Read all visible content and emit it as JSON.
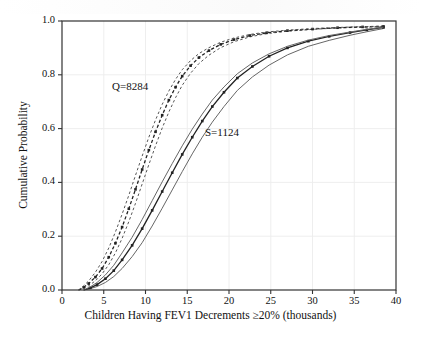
{
  "chart_data": {
    "type": "line",
    "title": "",
    "xlabel": "Children Having FEV1 Decrements ≥20% (thousands)",
    "ylabel": "Cumulative Probability",
    "xlim": [
      0,
      40
    ],
    "ylim": [
      0.0,
      1.0
    ],
    "xticks": [
      "0",
      "5",
      "10",
      "15",
      "20",
      "25",
      "30",
      "35",
      "40"
    ],
    "yticks": [
      "0.0",
      "0.2",
      "0.4",
      "0.6",
      "0.8",
      "1.0"
    ],
    "grid": true,
    "legend_position": "inline-annotations",
    "annotations": [
      {
        "text": "Q=8284",
        "x": 7.5,
        "y": 0.72
      },
      {
        "text": "S=1124",
        "x": 18.2,
        "y": 0.58
      }
    ],
    "series": [
      {
        "name": "Q=8284 lower bound",
        "style": "dashed",
        "color": "#555555",
        "x": [
          2.0,
          2.6,
          3.2,
          4.0,
          4.8,
          5.6,
          6.4,
          7.2,
          8.0,
          8.8,
          9.6,
          10.4,
          11.2,
          12.0,
          12.8,
          13.6,
          14.4,
          15.4,
          16.4,
          17.6,
          19.0,
          20.6,
          22.5,
          24.5,
          27.0,
          30.0,
          33.0,
          36.0,
          38.5
        ],
        "y": [
          0.0,
          0.006,
          0.016,
          0.034,
          0.06,
          0.094,
          0.138,
          0.192,
          0.254,
          0.322,
          0.394,
          0.466,
          0.536,
          0.602,
          0.662,
          0.715,
          0.761,
          0.806,
          0.842,
          0.873,
          0.901,
          0.923,
          0.941,
          0.953,
          0.962,
          0.969,
          0.974,
          0.977,
          0.979
        ]
      },
      {
        "name": "Q=8284 central estimate",
        "style": "dashed-marked",
        "color": "#222222",
        "x": [
          2.0,
          2.6,
          3.2,
          4.0,
          4.8,
          5.6,
          6.4,
          7.2,
          8.0,
          8.8,
          9.6,
          10.4,
          11.2,
          12.0,
          12.8,
          13.6,
          14.4,
          15.4,
          16.4,
          17.6,
          19.0,
          20.6,
          22.5,
          24.5,
          27.0,
          30.0,
          33.0,
          36.0,
          38.5
        ],
        "y": [
          0.0,
          0.01,
          0.024,
          0.048,
          0.08,
          0.122,
          0.174,
          0.234,
          0.302,
          0.374,
          0.448,
          0.52,
          0.588,
          0.65,
          0.706,
          0.754,
          0.795,
          0.834,
          0.864,
          0.89,
          0.913,
          0.931,
          0.946,
          0.956,
          0.964,
          0.97,
          0.975,
          0.978,
          0.98
        ]
      },
      {
        "name": "Q=8284 upper bound",
        "style": "dashed",
        "color": "#555555",
        "x": [
          2.0,
          2.6,
          3.2,
          4.0,
          4.8,
          5.6,
          6.4,
          7.2,
          8.0,
          8.8,
          9.6,
          10.4,
          11.2,
          12.0,
          12.8,
          13.6,
          14.4,
          15.4,
          16.4,
          17.6,
          19.0,
          20.6,
          22.5,
          24.5,
          27.0,
          30.0,
          33.0,
          36.0,
          38.5
        ],
        "y": [
          0.0,
          0.016,
          0.034,
          0.066,
          0.106,
          0.156,
          0.216,
          0.282,
          0.352,
          0.426,
          0.498,
          0.568,
          0.632,
          0.69,
          0.74,
          0.783,
          0.819,
          0.853,
          0.879,
          0.901,
          0.921,
          0.937,
          0.95,
          0.959,
          0.966,
          0.972,
          0.976,
          0.979,
          0.981
        ]
      },
      {
        "name": "S=1124 lower bound",
        "style": "solid",
        "color": "#666666",
        "x": [
          2.6,
          3.4,
          4.2,
          5.2,
          6.2,
          7.2,
          8.4,
          9.6,
          10.8,
          12.0,
          13.2,
          14.4,
          15.6,
          16.8,
          18.0,
          19.4,
          21.0,
          22.8,
          24.8,
          27.0,
          29.5,
          32.0,
          34.5,
          36.5,
          38.5
        ],
        "y": [
          0.0,
          0.005,
          0.013,
          0.028,
          0.05,
          0.08,
          0.124,
          0.176,
          0.238,
          0.304,
          0.372,
          0.44,
          0.506,
          0.568,
          0.624,
          0.682,
          0.742,
          0.792,
          0.836,
          0.874,
          0.906,
          0.928,
          0.947,
          0.96,
          0.972
        ]
      },
      {
        "name": "S=1124 central estimate",
        "style": "solid-marked",
        "color": "#222222",
        "x": [
          2.6,
          3.4,
          4.2,
          5.2,
          6.2,
          7.2,
          8.4,
          9.6,
          10.8,
          12.0,
          13.2,
          14.4,
          15.6,
          16.8,
          18.0,
          19.4,
          21.0,
          22.8,
          24.8,
          27.0,
          29.5,
          32.0,
          34.5,
          36.5,
          38.5
        ],
        "y": [
          0.0,
          0.008,
          0.02,
          0.042,
          0.072,
          0.112,
          0.166,
          0.228,
          0.296,
          0.366,
          0.436,
          0.504,
          0.568,
          0.628,
          0.682,
          0.735,
          0.788,
          0.831,
          0.869,
          0.9,
          0.925,
          0.943,
          0.957,
          0.967,
          0.976
        ]
      },
      {
        "name": "S=1124 upper bound",
        "style": "solid",
        "color": "#666666",
        "x": [
          2.6,
          3.4,
          4.2,
          5.2,
          6.2,
          7.2,
          8.4,
          9.6,
          10.8,
          12.0,
          13.2,
          14.4,
          15.6,
          16.8,
          18.0,
          19.4,
          21.0,
          22.8,
          24.8,
          27.0,
          29.5,
          32.0,
          34.5,
          36.5,
          38.5
        ],
        "y": [
          0.0,
          0.012,
          0.028,
          0.056,
          0.092,
          0.138,
          0.196,
          0.262,
          0.332,
          0.402,
          0.47,
          0.536,
          0.598,
          0.654,
          0.706,
          0.755,
          0.804,
          0.844,
          0.878,
          0.906,
          0.929,
          0.946,
          0.959,
          0.969,
          0.977
        ]
      }
    ],
    "colors": {
      "axis": "#333333",
      "grid": "#ececec",
      "background": "#ffffff",
      "text": "#111111"
    }
  }
}
